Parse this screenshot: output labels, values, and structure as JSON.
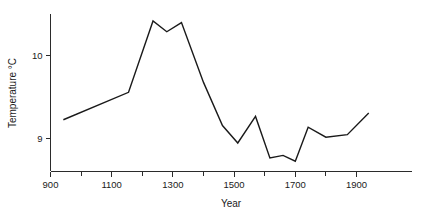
{
  "chart_data": {
    "type": "line",
    "title": "",
    "xlabel": "Year",
    "ylabel": "Temperature °C",
    "xlim": [
      900,
      1975
    ],
    "ylim": [
      8.55,
      10.65
    ],
    "grid": false,
    "legend": null,
    "x_major_ticks": [
      900,
      1100,
      1300,
      1500,
      1700,
      1900
    ],
    "x_minor_ticks": [
      1000,
      1200,
      1400,
      1600,
      1800
    ],
    "x_ticklabels": [
      "900",
      "1100",
      "1300",
      "1500",
      "1700",
      "1900"
    ],
    "y_major_ticks": [
      9,
      10
    ],
    "y_ticklabels": [
      "9",
      "10"
    ],
    "series": [
      {
        "name": "Reconstructed temperature",
        "color": "#1a1a1a",
        "x": [
          942,
          1155,
          1235,
          1280,
          1328,
          1400,
          1462,
          1512,
          1570,
          1617,
          1660,
          1700,
          1742,
          1800,
          1870,
          1940
        ],
        "y": [
          9.22,
          9.55,
          10.41,
          10.28,
          10.39,
          9.67,
          9.15,
          8.94,
          9.26,
          8.76,
          8.79,
          8.72,
          9.13,
          9.01,
          9.04,
          9.3
        ],
        "points": [
          {
            "year": 942,
            "temp": 9.22
          },
          {
            "year": 1155,
            "temp": 9.55
          },
          {
            "year": 1235,
            "temp": 10.41
          },
          {
            "year": 1280,
            "temp": 10.28
          },
          {
            "year": 1328,
            "temp": 10.39
          },
          {
            "year": 1400,
            "temp": 9.67
          },
          {
            "year": 1462,
            "temp": 9.15
          },
          {
            "year": 1512,
            "temp": 8.94
          },
          {
            "year": 1570,
            "temp": 9.26
          },
          {
            "year": 1617,
            "temp": 8.76
          },
          {
            "year": 1660,
            "temp": 8.79
          },
          {
            "year": 1700,
            "temp": 8.72
          },
          {
            "year": 1742,
            "temp": 9.13
          },
          {
            "year": 1800,
            "temp": 9.01
          },
          {
            "year": 1870,
            "temp": 9.04
          },
          {
            "year": 1940,
            "temp": 9.3
          }
        ]
      }
    ]
  },
  "axes": {
    "x_title": "Year",
    "y_title": "Temperature °C"
  }
}
